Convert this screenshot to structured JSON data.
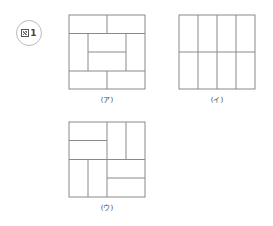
{
  "badge": {
    "text": "1",
    "icon": "zu-kanji-icon"
  },
  "figures": [
    {
      "id": "a",
      "label": "(ア)",
      "box": {
        "x": 69,
        "y": 15,
        "w": 76,
        "h": 74
      },
      "lines": [
        [
          0,
          18.5,
          76,
          18.5
        ],
        [
          0,
          56,
          76,
          56
        ],
        [
          38,
          0,
          38,
          18.5
        ],
        [
          38,
          56,
          38,
          74
        ],
        [
          19,
          18.5,
          19,
          56
        ],
        [
          57,
          18.5,
          57,
          56
        ],
        [
          19,
          37,
          57,
          37
        ]
      ]
    },
    {
      "id": "i",
      "label": "(イ)",
      "box": {
        "x": 179,
        "y": 15,
        "w": 76,
        "h": 74
      },
      "lines": [
        [
          19,
          0,
          19,
          74
        ],
        [
          38,
          0,
          38,
          74
        ],
        [
          57,
          0,
          57,
          74
        ],
        [
          0,
          37,
          76,
          37
        ]
      ]
    },
    {
      "id": "u",
      "label": "(ウ)",
      "box": {
        "x": 69,
        "y": 122,
        "w": 76,
        "h": 75
      },
      "lines": [
        [
          38,
          0,
          38,
          75
        ],
        [
          0,
          37.5,
          76,
          37.5
        ],
        [
          0,
          18.5,
          38,
          18.5
        ],
        [
          57,
          0,
          57,
          37.5
        ],
        [
          19,
          37.5,
          19,
          75
        ],
        [
          38,
          56,
          76,
          56
        ]
      ]
    }
  ],
  "colors": {
    "stroke": "#8a8a8a",
    "text": "#444444"
  }
}
